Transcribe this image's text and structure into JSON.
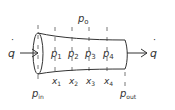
{
  "diagram": {
    "colors": {
      "stroke": "#333333",
      "dash": "#555555",
      "text": "#333333",
      "background": "#ffffff"
    },
    "flow": {
      "inlet_symbol": "q",
      "outlet_symbol": "q",
      "dot": "˙"
    },
    "ambient": {
      "symbol": "p",
      "subscript": "o"
    },
    "inlet_pressure": {
      "symbol": "p",
      "subscript": "in"
    },
    "outlet_pressure": {
      "symbol": "p",
      "subscript": "out"
    },
    "taps": [
      {
        "p_symbol": "p",
        "p_sub": "1",
        "x_symbol": "x",
        "x_sub": "1"
      },
      {
        "p_symbol": "p",
        "p_sub": "2",
        "x_symbol": "x",
        "x_sub": "2"
      },
      {
        "p_symbol": "p",
        "p_sub": "3",
        "x_symbol": "x",
        "x_sub": "3"
      },
      {
        "p_symbol": "p",
        "p_sub": "4",
        "x_symbol": "x",
        "x_sub": "4"
      }
    ]
  }
}
